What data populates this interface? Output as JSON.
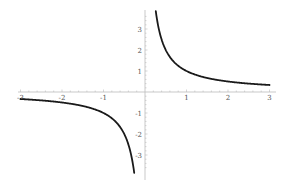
{
  "chart_data": {
    "type": "line",
    "title": "",
    "xlabel": "",
    "ylabel": "",
    "function": "y = 1/x",
    "xlim": [
      -3,
      3
    ],
    "ylim": [
      -3.8,
      3.8
    ],
    "grid": false,
    "legend": null,
    "x_ticks": [
      "-3",
      "-2",
      "-1",
      "1",
      "2",
      "3"
    ],
    "y_ticks": [
      "3",
      "2",
      "1",
      "-1",
      "-2",
      "-3"
    ],
    "series": [
      {
        "name": "1/x (x>0)",
        "x": [
          0.26,
          0.3,
          0.4,
          0.5,
          0.75,
          1,
          1.5,
          2,
          2.5,
          3
        ],
        "y": [
          3.85,
          3.33,
          2.5,
          2,
          1.33,
          1,
          0.67,
          0.5,
          0.4,
          0.33
        ]
      },
      {
        "name": "1/x (x<0)",
        "x": [
          -3,
          -2.5,
          -2,
          -1.5,
          -1,
          -0.75,
          -0.5,
          -0.4,
          -0.3,
          -0.26
        ],
        "y": [
          -0.33,
          -0.4,
          -0.5,
          -0.67,
          -1,
          -1.33,
          -2,
          -2.5,
          -3.33,
          -3.85
        ]
      }
    ],
    "line_color": "#1a1a1a",
    "axis_color": "#bbbbbb"
  }
}
